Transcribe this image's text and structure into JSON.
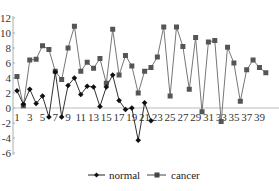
{
  "chart_data": {
    "type": "line",
    "title": "",
    "xlabel": "",
    "ylabel": "",
    "ylim": [
      -6,
      12
    ],
    "yticks": [
      12,
      10,
      8,
      6,
      4,
      2,
      0,
      -2,
      -4,
      -6
    ],
    "xticks": [
      1,
      3,
      5,
      7,
      9,
      11,
      13,
      15,
      17,
      19,
      21,
      23,
      25,
      27,
      29,
      31,
      33,
      35,
      37,
      39
    ],
    "grid": false,
    "legend_position": "bottom",
    "series": [
      {
        "name": "normal",
        "marker": "diamond",
        "color": "#111111",
        "x": [
          1,
          2,
          3,
          4,
          5,
          6,
          7,
          8,
          9,
          10,
          11,
          12,
          13,
          14,
          15,
          16,
          17,
          18,
          19,
          20,
          21,
          22
        ],
        "values": [
          2.3,
          0.5,
          2.5,
          0.6,
          1.6,
          -1.2,
          4.8,
          -1.2,
          3.0,
          4.0,
          1.8,
          2.9,
          2.8,
          0.2,
          2.8,
          4.4,
          1.0,
          -0.2,
          0.0,
          -4.3,
          0.7,
          -1.7
        ]
      },
      {
        "name": "cancer",
        "marker": "square",
        "color": "#555555",
        "x": [
          1,
          2,
          3,
          4,
          5,
          6,
          7,
          8,
          9,
          10,
          11,
          12,
          13,
          14,
          15,
          16,
          17,
          18,
          19,
          20,
          21,
          22,
          23,
          24,
          25,
          26,
          27,
          28,
          29,
          30,
          31,
          32,
          33,
          34,
          35,
          36,
          37,
          38,
          39,
          40
        ],
        "values": [
          4.2,
          0.3,
          6.4,
          6.5,
          8.3,
          7.8,
          4.9,
          3.8,
          8.0,
          10.9,
          4.9,
          6.1,
          5.3,
          6.6,
          3.3,
          10.5,
          4.4,
          7.0,
          5.6,
          2.0,
          4.9,
          5.4,
          6.8,
          10.8,
          1.6,
          10.8,
          8.2,
          2.5,
          9.4,
          -0.5,
          8.8,
          9.0,
          -1.8,
          8.1,
          6.0,
          0.9,
          5.1,
          6.4,
          5.4,
          4.7
        ]
      }
    ]
  },
  "legend": {
    "items": [
      {
        "label": "normal"
      },
      {
        "label": "cancer"
      }
    ]
  }
}
